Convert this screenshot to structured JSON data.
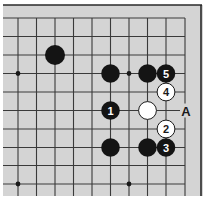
{
  "diagram": {
    "type": "go-board-fragment",
    "background": "#d4d4d4",
    "line_color": "#3a3a3a",
    "frame": {
      "top_y": 5,
      "right_x": 201,
      "left_x": 3,
      "bottom_y": 196
    },
    "grid": {
      "x": [
        18,
        36.5,
        55,
        73.5,
        92,
        110.5,
        129,
        147.5,
        166,
        185
      ],
      "y": [
        18,
        36.5,
        55,
        73.5,
        92,
        110.5,
        129,
        147.5,
        165.5,
        184
      ],
      "right_edge_col": 9
    },
    "star_points": [
      {
        "col": 0,
        "row": 3
      },
      {
        "col": 6,
        "row": 3
      },
      {
        "col": 0,
        "row": 9
      },
      {
        "col": 6,
        "row": 9
      }
    ],
    "stones": [
      {
        "color": "black",
        "col": 2,
        "row": 2,
        "label": ""
      },
      {
        "color": "black",
        "col": 5,
        "row": 3,
        "label": ""
      },
      {
        "color": "black",
        "col": 7,
        "row": 3,
        "label": ""
      },
      {
        "color": "black",
        "col": 8,
        "row": 3,
        "label": "5"
      },
      {
        "color": "white",
        "col": 8,
        "row": 4,
        "label": "4"
      },
      {
        "color": "black",
        "col": 5,
        "row": 5,
        "label": "1"
      },
      {
        "color": "white",
        "col": 7,
        "row": 5,
        "label": ""
      },
      {
        "color": "white",
        "col": 8,
        "row": 6,
        "label": "2"
      },
      {
        "color": "black",
        "col": 5,
        "row": 7,
        "label": ""
      },
      {
        "color": "black",
        "col": 7,
        "row": 7,
        "label": ""
      },
      {
        "color": "black",
        "col": 8,
        "row": 7,
        "label": "3"
      }
    ],
    "markers": [
      {
        "text": "A",
        "col": 9,
        "row": 5
      }
    ]
  }
}
